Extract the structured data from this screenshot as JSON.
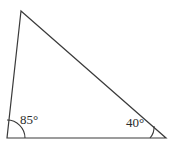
{
  "figure": {
    "kind": "triangle-diagram",
    "background_color": "#ffffff",
    "stroke_color": "#3a3a3a",
    "text_color": "#2b2b2b",
    "stroke_width": 1.2,
    "width": 172,
    "height": 145
  },
  "triangle": {
    "name": "scalene-triangle",
    "vertices": {
      "apex": {
        "label": "apex-vertex",
        "x": 21,
        "y": 11
      },
      "bottom_left": {
        "label": "bottom-left-vertex",
        "x": 7,
        "y": 138
      },
      "bottom_right": {
        "label": "bottom-right-vertex",
        "x": 166,
        "y": 138
      }
    },
    "points_path": "21,11 166,138 7,138",
    "sides": [
      {
        "name": "left-side",
        "from": "apex",
        "to": "bottom_left"
      },
      {
        "name": "base-side",
        "from": "bottom_left",
        "to": "bottom_right"
      },
      {
        "name": "hypotenuse-side",
        "from": "apex",
        "to": "bottom_right"
      }
    ]
  },
  "angles": {
    "left": {
      "name": "angle-85",
      "value": 85,
      "text": "85°",
      "arc_path": "M 7 120 A 18 18 0 0 1 25 138",
      "arc_radius": 18
    },
    "right": {
      "name": "angle-40",
      "value": 40,
      "text": "40°",
      "arc_path": "M 150 138 A 16 16 0 0 0 154 126",
      "arc_radius": 16
    }
  }
}
